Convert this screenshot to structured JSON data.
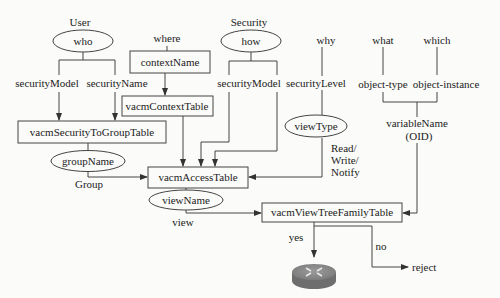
{
  "diagram": {
    "headers": {
      "user": "User",
      "where": "where",
      "security": "Security",
      "why": "why",
      "what": "what",
      "which": "which"
    },
    "ellipses": {
      "who": "who",
      "how": "how",
      "view_type": "viewType",
      "group_name": "groupName",
      "view_name": "viewName"
    },
    "boxes": {
      "context_name": "contextName",
      "vacm_context_table": "vacmContextTable",
      "vacm_security_to_group_table": "vacmSecurityToGroupTable",
      "vacm_access_table": "vacmAccessTable",
      "vacm_view_tree_family_table": "vacmViewTreeFamilyTable"
    },
    "labels": {
      "security_model_left": "securityModel",
      "security_name": "securityName",
      "security_model_right": "securityModel",
      "security_level": "securityLevel",
      "object_type": "object-type",
      "object_instance": "object-instance",
      "variable_name": "variableName",
      "oid": "(OID)",
      "read": "Read/",
      "write": "Write/",
      "notify": "Notify",
      "group": "Group",
      "view": "view",
      "yes": "yes",
      "no": "no",
      "reject": "reject"
    },
    "icons": {
      "router": "router-icon"
    }
  }
}
